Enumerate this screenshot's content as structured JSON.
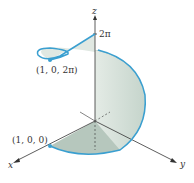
{
  "figure": {
    "type": "3d-helix-surface",
    "axes": {
      "x_label": "x",
      "y_label": "y",
      "z_label": "z"
    },
    "z_tick": "2π",
    "points": [
      {
        "label": "(1, 0, 0)",
        "role": "curve-start"
      },
      {
        "label": "(1, 0, 2π)",
        "role": "curve-end"
      }
    ],
    "colors": {
      "curve": "#3a9fd0",
      "surface": "#c9d8cf",
      "surface_dark": "#9fb4a7",
      "axes": "#333333"
    }
  }
}
